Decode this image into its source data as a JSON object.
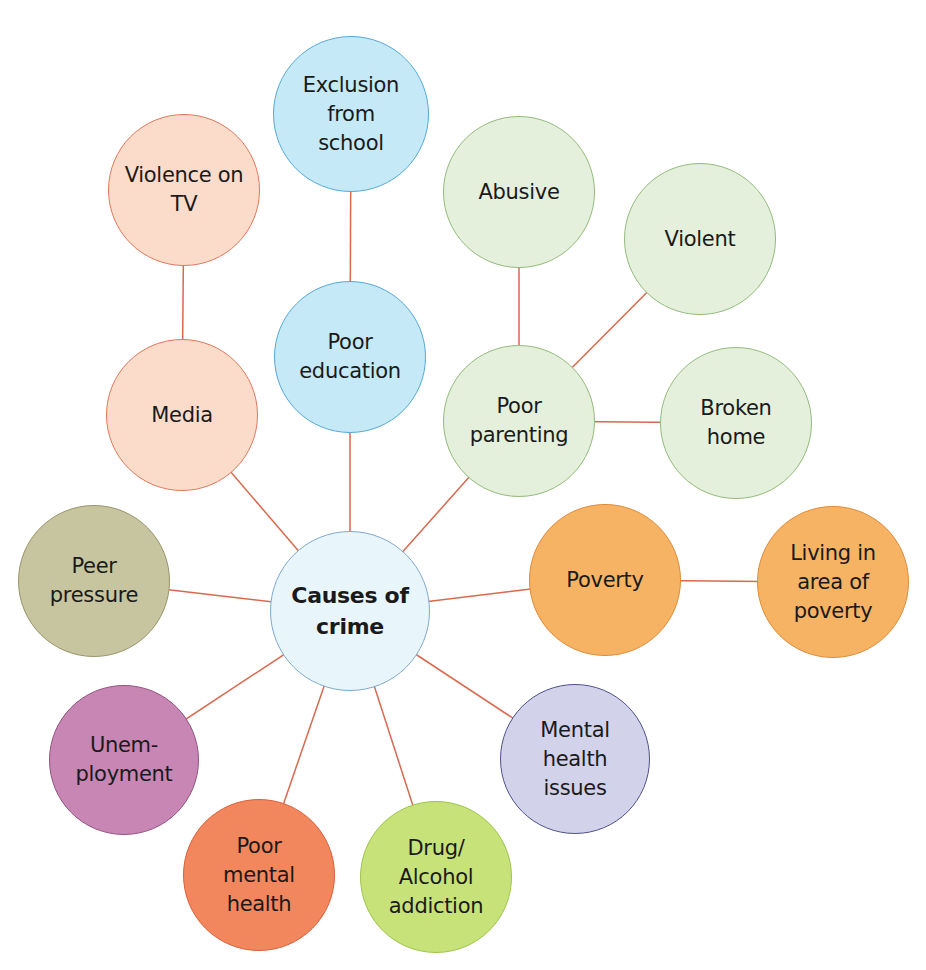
{
  "diagram": {
    "title": "Causes of crime",
    "line_color": "#d9694e",
    "center": {
      "id": "causes-of-crime",
      "label": "Causes of\ncrime",
      "cx": 350,
      "cy": 611,
      "r": 80,
      "fill": "#e8f5fb",
      "stroke": "#7fa9cf"
    },
    "nodes": [
      {
        "id": "exclusion-from-school",
        "label": "Exclusion\nfrom\nschool",
        "cx": 351,
        "cy": 114,
        "r": 78,
        "fill": "#c5e9f6",
        "stroke": "#55a9d8"
      },
      {
        "id": "violence-on-tv",
        "label": "Violence on\nTV",
        "cx": 184,
        "cy": 190,
        "r": 76,
        "fill": "#fbdccb",
        "stroke": "#e0785a"
      },
      {
        "id": "poor-education",
        "label": "Poor\neducation",
        "cx": 350,
        "cy": 357,
        "r": 76,
        "fill": "#c5e9f6",
        "stroke": "#55a9d8"
      },
      {
        "id": "media",
        "label": "Media",
        "cx": 182,
        "cy": 415,
        "r": 76,
        "fill": "#fbdccb",
        "stroke": "#e0785a"
      },
      {
        "id": "abusive",
        "label": "Abusive",
        "cx": 519,
        "cy": 192,
        "r": 76,
        "fill": "#e4efdc",
        "stroke": "#94bb7c"
      },
      {
        "id": "violent",
        "label": "Violent",
        "cx": 700,
        "cy": 239,
        "r": 76,
        "fill": "#e4efdc",
        "stroke": "#94bb7c"
      },
      {
        "id": "poor-parenting",
        "label": "Poor\nparenting",
        "cx": 519,
        "cy": 421,
        "r": 76,
        "fill": "#e4efdc",
        "stroke": "#94bb7c"
      },
      {
        "id": "broken-home",
        "label": "Broken\nhome",
        "cx": 736,
        "cy": 423,
        "r": 76,
        "fill": "#e4efdc",
        "stroke": "#94bb7c"
      },
      {
        "id": "peer-pressure",
        "label": "Peer\npressure",
        "cx": 94,
        "cy": 581,
        "r": 76,
        "fill": "#c7c5a0",
        "stroke": "#98956a"
      },
      {
        "id": "poverty",
        "label": "Poverty",
        "cx": 605,
        "cy": 580,
        "r": 76,
        "fill": "#f6b364",
        "stroke": "#e08a3a"
      },
      {
        "id": "living-in-area-of-poverty",
        "label": "Living in\narea of\npoverty",
        "cx": 833,
        "cy": 582,
        "r": 76,
        "fill": "#f6b364",
        "stroke": "#e08a3a"
      },
      {
        "id": "unemployment",
        "label": "Unem-\nployment",
        "cx": 124,
        "cy": 760,
        "r": 75,
        "fill": "#c886b4",
        "stroke": "#94527f"
      },
      {
        "id": "mental-health-issues",
        "label": "Mental\nhealth\nissues",
        "cx": 575,
        "cy": 759,
        "r": 75,
        "fill": "#d2d2ea",
        "stroke": "#505088"
      },
      {
        "id": "poor-mental-health",
        "label": "Poor\nmental\nhealth",
        "cx": 259,
        "cy": 875,
        "r": 76,
        "fill": "#f2875d",
        "stroke": "#d8603a"
      },
      {
        "id": "drug-alcohol-addiction",
        "label": "Drug/\nAlcohol\naddiction",
        "cx": 436,
        "cy": 877,
        "r": 76,
        "fill": "#c8e27a",
        "stroke": "#9ec44c"
      }
    ],
    "edges": [
      {
        "from": "exclusion-from-school",
        "to": "poor-education"
      },
      {
        "from": "violence-on-tv",
        "to": "media"
      },
      {
        "from": "abusive",
        "to": "poor-parenting"
      },
      {
        "from": "violent",
        "to": "poor-parenting"
      },
      {
        "from": "poor-parenting",
        "to": "broken-home"
      },
      {
        "from": "poverty",
        "to": "living-in-area-of-poverty"
      },
      {
        "from": "causes-of-crime",
        "to": "poor-education"
      },
      {
        "from": "causes-of-crime",
        "to": "media"
      },
      {
        "from": "causes-of-crime",
        "to": "poor-parenting"
      },
      {
        "from": "causes-of-crime",
        "to": "peer-pressure"
      },
      {
        "from": "causes-of-crime",
        "to": "poverty"
      },
      {
        "from": "causes-of-crime",
        "to": "unemployment"
      },
      {
        "from": "causes-of-crime",
        "to": "mental-health-issues"
      },
      {
        "from": "causes-of-crime",
        "to": "poor-mental-health"
      },
      {
        "from": "causes-of-crime",
        "to": "drug-alcohol-addiction"
      }
    ]
  }
}
